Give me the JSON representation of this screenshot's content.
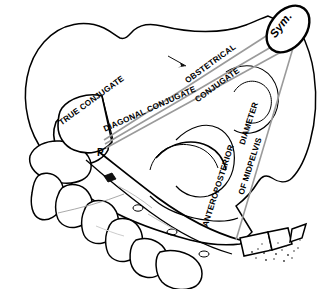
{
  "figure": {
    "background_color": "#ffffff",
    "outline_color": "#000000",
    "measure_line_color": "#999999"
  },
  "labels": {
    "true_conjugate": "TRUE CONJUGATE",
    "obstetrical_line1": "OBSTETRICAL",
    "obstetrical_line2": "CONJUGATE",
    "diagonal_conjugate": "DIAGONAL CONJUGATE",
    "ap_line1": "ANTEROPOSTERIOR",
    "ap_line2": "OF MIDPELVIS",
    "ap_diameter": "DIAMETER",
    "promontory": "P.",
    "symphysis": "Sym."
  },
  "anatomy": {
    "promontory_full": "Sacral promontory",
    "symphysis_full": "Symphysis pubis",
    "structures": [
      "Ilium",
      "Sacrum",
      "Coccyx",
      "Symphysis pubis",
      "Acetabulum",
      "Sacral promontory"
    ]
  },
  "measurements": [
    {
      "name": "TRUE CONJUGATE",
      "from": "Sacral promontory",
      "to": "Symphysis pubis (upper margin)"
    },
    {
      "name": "OBSTETRICAL CONJUGATE",
      "from": "Sacral promontory",
      "to": "Symphysis pubis (inner posterior surface)"
    },
    {
      "name": "DIAGONAL CONJUGATE",
      "from": "Sacral promontory",
      "to": "Symphysis pubis (lower margin)"
    },
    {
      "name": "ANTEROPOSTERIOR DIAMETER OF MIDPELVIS",
      "from": "Coccyx / sacrum lower",
      "to": "Symphysis pubis"
    }
  ]
}
